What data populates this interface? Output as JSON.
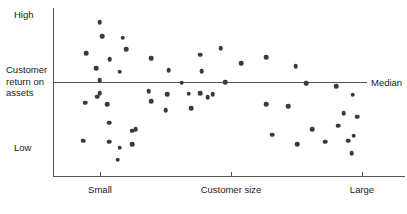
{
  "chart_data": {
    "type": "scatter",
    "title": "",
    "xlabel": "Customer size",
    "ylabel": "Customer return on assets",
    "x_tick_labels": [
      "Small",
      "Customer size",
      "Large"
    ],
    "y_tick_labels": [
      "High",
      "Customer return on assets",
      "Low"
    ],
    "grid": false,
    "legend": "none",
    "annotations": [
      {
        "name": "median-line",
        "label": "Median",
        "type": "horizontal-reference-line",
        "y_value": 0
      }
    ],
    "axis_ranges": {
      "x": [
        0,
        100
      ],
      "y": [
        0,
        100
      ]
    },
    "point_color": "#3a3a3a",
    "axis_color": "#555555",
    "points": [
      {
        "x": 13.3,
        "y": 91.5
      },
      {
        "x": 13.9,
        "y": 83.2
      },
      {
        "x": 19.8,
        "y": 82.2
      },
      {
        "x": 20.8,
        "y": 75.6
      },
      {
        "x": 9.5,
        "y": 73.2
      },
      {
        "x": 16.1,
        "y": 69.6
      },
      {
        "x": 12.2,
        "y": 64.3
      },
      {
        "x": 19.0,
        "y": 62.2
      },
      {
        "x": 13.3,
        "y": 57.1
      },
      {
        "x": 13.3,
        "y": 49.2
      },
      {
        "x": 9.2,
        "y": 43.6
      },
      {
        "x": 12.6,
        "y": 47.2
      },
      {
        "x": 15.4,
        "y": 42.9
      },
      {
        "x": 15.9,
        "y": 31.7
      },
      {
        "x": 8.6,
        "y": 20.9
      },
      {
        "x": 15.9,
        "y": 20.3
      },
      {
        "x": 18.9,
        "y": 16.9
      },
      {
        "x": 22.5,
        "y": 26.9
      },
      {
        "x": 22.5,
        "y": 18.8
      },
      {
        "x": 18.4,
        "y": 9.8
      },
      {
        "x": 27.9,
        "y": 70.1
      },
      {
        "x": 32.9,
        "y": 63.0
      },
      {
        "x": 41.8,
        "y": 72.1
      },
      {
        "x": 42.3,
        "y": 62.5
      },
      {
        "x": 36.6,
        "y": 55.5
      },
      {
        "x": 27.2,
        "y": 50.6
      },
      {
        "x": 32.4,
        "y": 48.6
      },
      {
        "x": 38.5,
        "y": 48.9
      },
      {
        "x": 41.8,
        "y": 49.3
      },
      {
        "x": 45.4,
        "y": 48.7
      },
      {
        "x": 27.9,
        "y": 44.6
      },
      {
        "x": 32.0,
        "y": 39.0
      },
      {
        "x": 39.3,
        "y": 40.2
      },
      {
        "x": 23.5,
        "y": 27.9
      },
      {
        "x": 49.0,
        "y": 55.9
      },
      {
        "x": 47.6,
        "y": 75.9
      },
      {
        "x": 53.4,
        "y": 67.3
      },
      {
        "x": 60.5,
        "y": 70.8
      },
      {
        "x": 68.9,
        "y": 65.2
      },
      {
        "x": 44.0,
        "y": 47.0
      },
      {
        "x": 60.5,
        "y": 42.9
      },
      {
        "x": 66.8,
        "y": 41.5
      },
      {
        "x": 71.9,
        "y": 55.1
      },
      {
        "x": 80.4,
        "y": 53.5
      },
      {
        "x": 85.1,
        "y": 48.3
      },
      {
        "x": 82.6,
        "y": 37.5
      },
      {
        "x": 86.5,
        "y": 35.2
      },
      {
        "x": 81.0,
        "y": 29.9
      },
      {
        "x": 73.6,
        "y": 28.0
      },
      {
        "x": 85.4,
        "y": 23.9
      },
      {
        "x": 77.3,
        "y": 20.5
      },
      {
        "x": 83.9,
        "y": 20.9
      },
      {
        "x": 84.9,
        "y": 13.5
      },
      {
        "x": 62.2,
        "y": 24.5
      },
      {
        "x": 69.4,
        "y": 19.0
      }
    ]
  },
  "labels": {
    "y_high": "High",
    "y_low": "Low",
    "y_axis_title": "Customer return on assets",
    "median": "Median",
    "x_small": "Small",
    "x_title": "Customer size",
    "x_large": "Large"
  }
}
